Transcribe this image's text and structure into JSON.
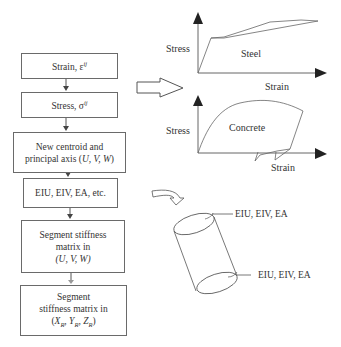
{
  "flowchart": {
    "boxes": [
      {
        "id": "strain",
        "text": "Strain, ε",
        "sup": "ij"
      },
      {
        "id": "stress",
        "text": "Stress, σ",
        "sup": "ij"
      },
      {
        "id": "centroid",
        "line1": "New centroid and",
        "line2_prefix": "principal axis (",
        "line2_vars": "U, V, W",
        "line2_suffix": ")"
      },
      {
        "id": "rigidities",
        "text": "EIU, EIV, EA, etc."
      },
      {
        "id": "seg-local",
        "line1": "Segment stiffness",
        "line2": "matrix in",
        "line3": "(U, V, W)"
      },
      {
        "id": "seg-global",
        "line1": "Segment",
        "line2": "stiffness matrix in",
        "line3_open": "(",
        "x": "X",
        "y": "Y",
        "z": "Z",
        "sub": "R",
        "sep": ", ",
        "line3_close": ")"
      }
    ]
  },
  "charts": {
    "steel": {
      "ylabel": "Stress",
      "xlabel": "Strain",
      "title": "Steel"
    },
    "concrete": {
      "ylabel": "Stress",
      "xlabel": "Strain",
      "title": "Concrete"
    }
  },
  "cylinder": {
    "top_label": "EIU, EIV, EA",
    "bottom_label": "EIU, EIV, EA"
  },
  "colors": {
    "line": "#6a6a6a",
    "text": "#333333",
    "background": "#ffffff"
  }
}
